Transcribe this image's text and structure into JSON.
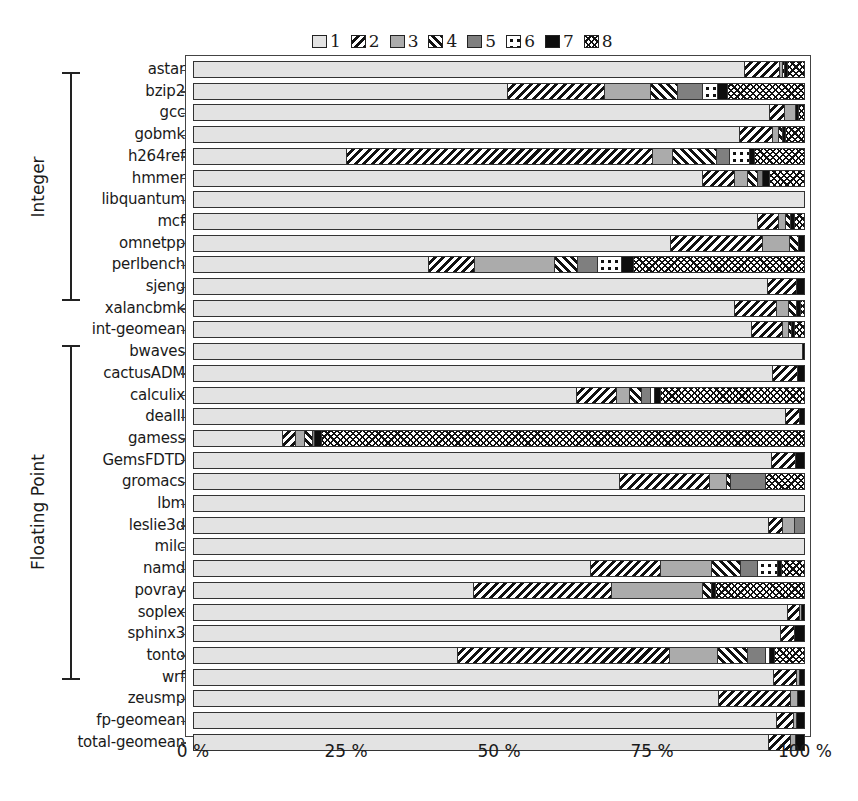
{
  "chart_data": {
    "type": "bar",
    "orientation": "horizontal",
    "stacked": true,
    "normalized": true,
    "title": "",
    "xlabel": "",
    "ylabel": "",
    "xlim": [
      0,
      100
    ],
    "x_ticks": [
      "0 %",
      "25 %",
      "50 %",
      "75 %",
      "100 %"
    ],
    "grid": false,
    "legend_position": "top",
    "legend": [
      "1",
      "2",
      "3",
      "4",
      "5",
      "6",
      "7",
      "8"
    ],
    "groups": [
      {
        "label": "Integer",
        "from": "astar",
        "to": "xalancbmk"
      },
      {
        "label": "Floating Point",
        "from": "bwaves",
        "to": "zeusmp"
      }
    ],
    "categories": [
      "astar",
      "bzip2",
      "gcc",
      "gobmk",
      "h264ref",
      "hmmer",
      "libquantum",
      "mcf",
      "omnetpp",
      "perlbench",
      "sjeng",
      "xalancbmk",
      "int-geomean",
      "bwaves",
      "cactusADM",
      "calculix",
      "dealII",
      "gamess",
      "GemsFDTD",
      "gromacs",
      "lbm",
      "leslie3d",
      "milc",
      "namd",
      "povray",
      "soplex",
      "sphinx3",
      "tonto",
      "wrf",
      "zeusmp",
      "fp-geomean",
      "total-geomean"
    ],
    "series": [
      {
        "name": "1",
        "values": [
          90.3,
          51.4,
          94.5,
          89.5,
          25.0,
          83.4,
          100,
          92.5,
          78.2,
          38.6,
          94.1,
          88.7,
          91.4,
          99.8,
          94.9,
          62.8,
          97.1,
          14.6,
          94.8,
          69.8,
          100,
          94.3,
          100,
          65.0,
          45.9,
          97.4,
          96.2,
          43.2,
          95.1,
          86.1,
          95.6,
          94.2
        ]
      },
      {
        "name": "2",
        "values": [
          5.7,
          16.0,
          2.4,
          5.4,
          50.2,
          5.3,
          0,
          3.4,
          15.1,
          7.4,
          4.8,
          6.8,
          5.1,
          0,
          4.2,
          6.5,
          2.2,
          2.2,
          3.9,
          14.8,
          0,
          2.3,
          0,
          11.6,
          22.7,
          2.0,
          2.3,
          34.9,
          3.7,
          11.8,
          2.8,
          3.7
        ]
      },
      {
        "name": "3",
        "values": [
          0.5,
          7.6,
          1.8,
          1.0,
          3.3,
          2.2,
          0,
          1.2,
          4.4,
          13.2,
          0,
          2.0,
          1.0,
          0,
          0,
          2.2,
          0,
          1.4,
          0,
          2.7,
          0,
          1.9,
          0,
          8.3,
          14.8,
          0.3,
          0,
          7.8,
          0.6,
          1.2,
          0.5,
          0.8
        ]
      },
      {
        "name": "4",
        "values": [
          0.4,
          4.3,
          0,
          0.6,
          7.2,
          1.6,
          0,
          0.8,
          1.5,
          3.8,
          0,
          1.4,
          0.5,
          0,
          0,
          2.0,
          0,
          1.3,
          0,
          0.7,
          0,
          0,
          0,
          4.8,
          1.5,
          0,
          0,
          5.0,
          0,
          0,
          0,
          0
        ]
      },
      {
        "name": "5",
        "values": [
          0,
          4.1,
          0,
          0,
          2.2,
          0.8,
          0,
          0,
          0,
          3.2,
          0,
          0,
          0,
          0,
          0,
          1.4,
          0,
          0.4,
          0,
          5.8,
          0,
          1.5,
          0,
          2.8,
          0,
          0,
          0,
          2.8,
          0,
          0,
          0,
          0
        ]
      },
      {
        "name": "6",
        "values": [
          0,
          2.5,
          0,
          0,
          3.2,
          0,
          0,
          0,
          0,
          4.0,
          0,
          0,
          0,
          0,
          0,
          0.7,
          0,
          0,
          0,
          0,
          0,
          0,
          0,
          3.2,
          0,
          0,
          0,
          0.8,
          0,
          0,
          0,
          0
        ]
      },
      {
        "name": "7",
        "values": [
          0.4,
          1.6,
          0.5,
          0.6,
          0.9,
          1.1,
          0,
          0.6,
          0.8,
          2.0,
          1.1,
          0.6,
          0.5,
          0.2,
          0.9,
          1.0,
          0.7,
          1.1,
          1.3,
          0,
          0,
          0,
          0,
          0.7,
          0.7,
          0.3,
          1.5,
          0.7,
          0.6,
          0.9,
          1.1,
          1.3
        ]
      },
      {
        "name": "8",
        "values": [
          2.7,
          12.5,
          0.8,
          2.9,
          8.0,
          5.6,
          0,
          1.5,
          0,
          27.8,
          0,
          0.5,
          1.5,
          0,
          0,
          23.4,
          0,
          79.0,
          0,
          6.2,
          0,
          0,
          0,
          3.6,
          14.4,
          0,
          0,
          4.8,
          0,
          0,
          0,
          0
        ]
      }
    ]
  },
  "colors": {
    "pattern_1": "#e3e3e3",
    "pattern_3": "#ababab",
    "pattern_5": "#7f7f7f",
    "pattern_7": "#0d0d0d",
    "frame": "#444444"
  },
  "legend": {
    "items": [
      {
        "label": "1",
        "pattern": "p1"
      },
      {
        "label": "2",
        "pattern": "p2"
      },
      {
        "label": "3",
        "pattern": "p3"
      },
      {
        "label": "4",
        "pattern": "p4"
      },
      {
        "label": "5",
        "pattern": "p5"
      },
      {
        "label": "6",
        "pattern": "p6"
      },
      {
        "label": "7",
        "pattern": "p7"
      },
      {
        "label": "8",
        "pattern": "p8"
      }
    ]
  },
  "group_labels": {
    "integer": "Integer",
    "floating_point": "Floating Point"
  }
}
